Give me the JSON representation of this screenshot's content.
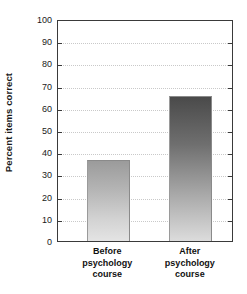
{
  "chart_data": {
    "type": "bar",
    "title": "",
    "xlabel": "",
    "ylabel": "Percent items correct",
    "categories": [
      "Before psychology course",
      "After psychology course"
    ],
    "category_lines": [
      [
        "Before",
        "psychology",
        "course"
      ],
      [
        "After",
        "psychology",
        "course"
      ]
    ],
    "values": [
      36.5,
      65.5
    ],
    "ylim": [
      0,
      100
    ],
    "ytick_step": 10,
    "yticks": [
      0,
      10,
      20,
      30,
      40,
      50,
      60,
      70,
      80,
      90,
      100
    ],
    "ytick_labels": [
      "0",
      "10",
      "20",
      "30",
      "40",
      "50",
      "60",
      "70",
      "80",
      "90",
      "100"
    ],
    "grid": true,
    "grid_axis": "y",
    "grid_style": "dotted",
    "legend": false,
    "bar_styles": [
      {
        "name": "before-bar",
        "fill": "gradient-light-gray",
        "top_color": "#9b9b9b",
        "bottom_color": "#e4e4e4"
      },
      {
        "name": "after-bar",
        "fill": "gradient-dark-gray",
        "top_color": "#4a4a4a",
        "bottom_color": "#dcdcdc"
      }
    ],
    "colors": {
      "axis": "#3a3a3a",
      "grid": "#c9c9c9",
      "text": "#1a1a1a",
      "background": "#ffffff"
    }
  }
}
